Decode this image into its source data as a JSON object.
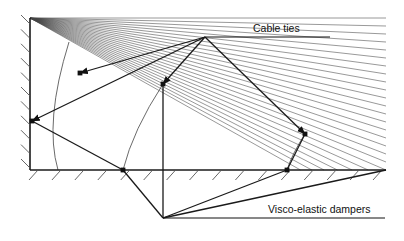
{
  "figure": {
    "background_color": "#ffffff",
    "line_color": "#1a1a1a",
    "fan_line_color": "#444444",
    "width": 404,
    "height": 241
  },
  "labels": {
    "cable_ties": "Cable ties",
    "visco_elastic_dampers": "Visco-elastic dampers"
  },
  "supports": {
    "wall": {
      "name": "vertical-wall",
      "x": 30,
      "y_top": 18,
      "y_bottom": 170,
      "hatch_side": "left",
      "hatch_count": 11
    },
    "ground": {
      "name": "ground-line",
      "y": 170,
      "x_start": 30,
      "x_end": 386,
      "hatch_side": "below",
      "hatch_count": 16
    }
  },
  "nodes": {
    "wall_top": {
      "x": 30,
      "y": 18
    },
    "wall_damper": {
      "x": 32,
      "y": 121
    },
    "wall_base": {
      "x": 30,
      "y": 170
    },
    "apex": {
      "x": 205,
      "y": 37
    },
    "damper_upper_left": {
      "x": 80,
      "y": 73
    },
    "damper_mid": {
      "x": 163,
      "y": 84
    },
    "damper_right": {
      "x": 305,
      "y": 134
    },
    "damper_ground_left": {
      "x": 123,
      "y": 170
    },
    "damper_ground_right": {
      "x": 287,
      "y": 170
    },
    "bottom_vertex": {
      "x": 163,
      "y": 218
    },
    "ground_right_end": {
      "x": 386,
      "y": 170
    }
  },
  "fan": {
    "origin": {
      "x": 30,
      "y": 18
    },
    "line_count": 26,
    "spread_start_y": 18,
    "spread_end_y": 218,
    "target_x": 386
  },
  "arcs": [
    {
      "name": "arc-left",
      "start": {
        "x": 69,
        "y": 42
      },
      "ctrl": {
        "x": 44,
        "y": 122
      },
      "end": {
        "x": 58,
        "y": 170
      }
    },
    {
      "name": "arc-mid",
      "start": {
        "x": 163,
        "y": 84
      },
      "ctrl": {
        "x": 133,
        "y": 130
      },
      "end": {
        "x": 123,
        "y": 170
      }
    },
    {
      "name": "arc-right",
      "start": {
        "x": 305,
        "y": 134
      },
      "ctrl": {
        "x": 292,
        "y": 154
      },
      "end": {
        "x": 287,
        "y": 170
      }
    }
  ],
  "members": [
    {
      "name": "tie-apex-to-wall-damper",
      "from": "apex",
      "to": "wall_damper",
      "arrow": true
    },
    {
      "name": "tie-apex-to-damper-upper-left",
      "from": "apex",
      "to": "damper_upper_left",
      "arrow": true
    },
    {
      "name": "tie-apex-to-damper-mid",
      "from": "apex",
      "to": "damper_mid",
      "arrow": true
    },
    {
      "name": "tie-apex-to-damper-right",
      "from": "apex",
      "to": "damper_right",
      "arrow": true
    },
    {
      "name": "strut-wall-damper-to-ground-left",
      "from": "wall_damper",
      "to": "damper_ground_left",
      "arrow": false
    },
    {
      "name": "strut-damper-mid-to-bottom",
      "from": "damper_mid",
      "to": "bottom_vertex",
      "arrow": false
    },
    {
      "name": "strut-ground-left-to-bottom",
      "from": "damper_ground_left",
      "to": "bottom_vertex",
      "arrow": false
    },
    {
      "name": "strut-bottom-to-ground-right",
      "from": "bottom_vertex",
      "to": "damper_ground_right",
      "arrow": false
    },
    {
      "name": "strut-bottom-to-ground-end",
      "from": "bottom_vertex",
      "to": "ground_right_end",
      "arrow": false
    },
    {
      "name": "strut-damper-right-to-ground-right",
      "from": "damper_right",
      "to": "damper_ground_right",
      "arrow": false
    }
  ],
  "leaders": {
    "cable_ties": {
      "from": {
        "x": 205,
        "y": 37
      },
      "to": {
        "x": 330,
        "y": 37
      },
      "text_x": 253,
      "text_y": 32
    },
    "visco_elastic_dampers": {
      "from": {
        "x": 163,
        "y": 218
      },
      "to": {
        "x": 385,
        "y": 218
      },
      "text_x": 268,
      "text_y": 213
    }
  }
}
